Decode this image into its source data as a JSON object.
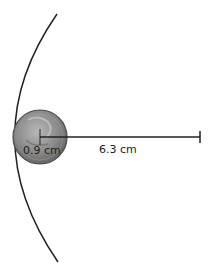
{
  "diagram": {
    "coin_label": "0.9 cm",
    "distance_label": "6.3 cm",
    "colors": {
      "stroke": "#222222",
      "coin_fill": "#8e8e8e",
      "coin_edge": "#5a5a5a",
      "background": "#ffffff"
    }
  }
}
